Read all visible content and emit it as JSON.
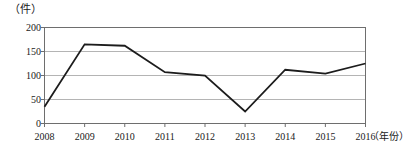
{
  "chart_data": {
    "type": "line",
    "title": "",
    "xlabel": "（年份）",
    "ylabel": "（件）",
    "categories": [
      "2008",
      "2009",
      "2010",
      "2011",
      "2012",
      "2013",
      "2014",
      "2015",
      "2016"
    ],
    "values": [
      35,
      165,
      162,
      107,
      100,
      25,
      112,
      104,
      125
    ],
    "series": [
      {
        "name": "件数",
        "values": [
          35,
          165,
          162,
          107,
          100,
          25,
          112,
          104,
          125
        ]
      }
    ],
    "ylim": [
      0,
      200
    ],
    "yticks": [
      0,
      50,
      100,
      150,
      200
    ],
    "ytick_labels": [
      "0",
      "50",
      "100",
      "150",
      "200"
    ],
    "grid": "horizontal",
    "legend": "none",
    "markers": "none",
    "line_color": "#1c1c1c",
    "grid_color": "#b4b4b4",
    "axis_color": "#6e6e6e",
    "background": "#ffffff"
  }
}
